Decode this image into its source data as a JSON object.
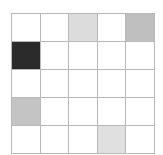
{
  "grid": {
    "rows": 5,
    "cols": 5,
    "cells": [
      [
        "#ffffff",
        "#ffffff",
        "#dcdcdc",
        "#ffffff",
        "#bfbfbf"
      ],
      [
        "#2b2b2b",
        "#ffffff",
        "#ffffff",
        "#ffffff",
        "#ffffff"
      ],
      [
        "#ffffff",
        "#ffffff",
        "#ffffff",
        "#ffffff",
        "#ffffff"
      ],
      [
        "#c4c4c4",
        "#ffffff",
        "#ffffff",
        "#ffffff",
        "#ffffff"
      ],
      [
        "#ffffff",
        "#ffffff",
        "#ffffff",
        "#e0e0e0",
        "#ffffff"
      ]
    ]
  }
}
